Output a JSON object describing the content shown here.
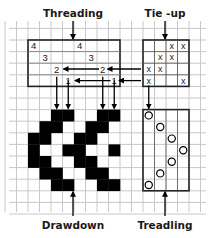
{
  "labels": {
    "threading": "Threading",
    "tieup": "Tie -up",
    "drawdown": "Drawdown",
    "treadling": "Treadling"
  },
  "colors": {
    "grid": "#c8c8c8",
    "frame": "#222222",
    "ink": "#000000",
    "background": "#ffffff"
  },
  "threading": {
    "shafts": 4,
    "ends": 8,
    "entries": [
      {
        "end": 1,
        "shaft": 4,
        "label": "4"
      },
      {
        "end": 2,
        "shaft": 3,
        "label": "3"
      },
      {
        "end": 3,
        "shaft": 2,
        "label": "2"
      },
      {
        "end": 4,
        "shaft": 1,
        "label": "1"
      },
      {
        "end": 5,
        "shaft": 4,
        "label": "4"
      },
      {
        "end": 6,
        "shaft": 3,
        "label": "3"
      },
      {
        "end": 7,
        "shaft": 2,
        "label": "2"
      },
      {
        "end": 8,
        "shaft": 1,
        "label": "1"
      }
    ]
  },
  "tieup": {
    "mark": "x",
    "rows_top_to_bottom_shaft": [
      4,
      3,
      2,
      1
    ],
    "cells": [
      [
        0,
        0,
        1,
        1
      ],
      [
        0,
        1,
        1,
        0
      ],
      [
        1,
        1,
        0,
        0
      ],
      [
        1,
        0,
        0,
        1
      ]
    ]
  },
  "treadling": {
    "treadles": 4,
    "picks": 7,
    "sequence": [
      1,
      2,
      3,
      4,
      3,
      2,
      1
    ]
  },
  "drawdown": {
    "rows": [
      "..XX..XX",
      ".XX..XX.",
      "XX..XX..",
      "X..XX..X",
      "XX..XX..",
      ".XX..XX.",
      "..XX..XX"
    ]
  }
}
